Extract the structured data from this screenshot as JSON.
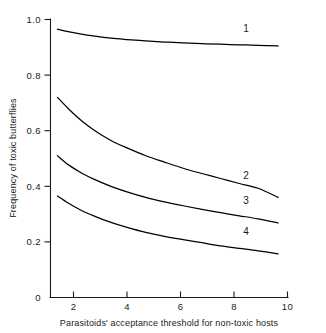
{
  "chart_data": {
    "type": "line",
    "title": "",
    "xlabel": "Parasitoids' acceptance threshold for non-toxic hosts",
    "ylabel": "Frequency of toxic butterflies",
    "xlim": [
      0,
      10
    ],
    "ylim": [
      0,
      1.0
    ],
    "grid": false,
    "legend_position": "inline-end-of-curve",
    "xticks": [
      {
        "value": 2,
        "label": "2"
      },
      {
        "value": 4,
        "label": "4"
      },
      {
        "value": 6,
        "label": "6"
      },
      {
        "value": 8,
        "label": "8"
      },
      {
        "value": 10,
        "label": "10"
      }
    ],
    "yticks": [
      {
        "value": 0,
        "label": "0"
      },
      {
        "value": 0.2,
        "label": "0.2"
      },
      {
        "value": 0.4,
        "label": "0.4"
      },
      {
        "value": 0.6,
        "label": "0.6"
      },
      {
        "value": 0.8,
        "label": "0.8"
      },
      {
        "value": 1.0,
        "label": "1.0"
      }
    ],
    "series": [
      {
        "name": "1",
        "label": "1",
        "label_x": 8.45,
        "label_y": 0.955,
        "x": [
          1.4,
          1.8,
          2.3,
          2.8,
          3.4,
          4.0,
          4.7,
          5.4,
          6.1,
          6.8,
          7.5,
          8.2,
          8.9,
          9.65
        ],
        "y": [
          0.965,
          0.956,
          0.947,
          0.94,
          0.933,
          0.928,
          0.923,
          0.919,
          0.916,
          0.913,
          0.911,
          0.909,
          0.907,
          0.905
        ]
      },
      {
        "name": "2",
        "label": "2",
        "label_x": 8.45,
        "label_y": 0.425,
        "x": [
          1.4,
          1.8,
          2.3,
          2.8,
          3.4,
          4.0,
          4.7,
          5.4,
          6.1,
          6.8,
          7.5,
          8.2,
          8.9,
          9.65
        ],
        "y": [
          0.72,
          0.68,
          0.636,
          0.6,
          0.565,
          0.538,
          0.51,
          0.487,
          0.465,
          0.446,
          0.428,
          0.41,
          0.393,
          0.36
        ]
      },
      {
        "name": "3",
        "label": "3",
        "label_x": 8.45,
        "label_y": 0.335,
        "x": [
          1.4,
          1.8,
          2.3,
          2.8,
          3.4,
          4.0,
          4.7,
          5.4,
          6.1,
          6.8,
          7.5,
          8.2,
          8.9,
          9.65
        ],
        "y": [
          0.51,
          0.478,
          0.448,
          0.424,
          0.4,
          0.38,
          0.36,
          0.344,
          0.33,
          0.317,
          0.305,
          0.294,
          0.283,
          0.268
        ]
      },
      {
        "name": "4",
        "label": "4",
        "label_x": 8.45,
        "label_y": 0.225,
        "x": [
          1.4,
          1.8,
          2.3,
          2.8,
          3.4,
          4.0,
          4.7,
          5.4,
          6.1,
          6.8,
          7.5,
          8.2,
          8.9,
          9.65
        ],
        "y": [
          0.365,
          0.34,
          0.313,
          0.292,
          0.27,
          0.252,
          0.234,
          0.22,
          0.208,
          0.197,
          0.186,
          0.177,
          0.168,
          0.157
        ]
      }
    ],
    "colors": {
      "axis": "#1a1a1a",
      "curve": "#000000",
      "background": "#ffffff"
    }
  }
}
